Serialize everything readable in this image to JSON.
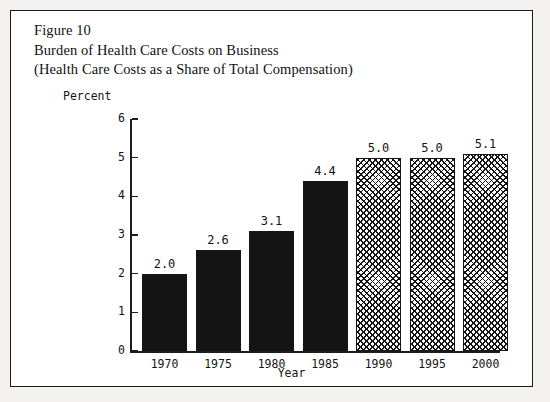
{
  "figure": {
    "title_lines": [
      "Figure 10",
      "Burden of Health Care Costs on Business",
      "(Health Care Costs as a Share of Total Compensation)"
    ]
  },
  "chart_data": {
    "type": "bar",
    "title": "Burden of Health Care Costs on Business (Health Care Costs as a Share of Total Compensation)",
    "categories": [
      "1970",
      "1975",
      "1980",
      "1985",
      "1990",
      "1995",
      "2000"
    ],
    "values": [
      2.0,
      2.6,
      3.1,
      4.4,
      5.0,
      5.0,
      5.1
    ],
    "value_labels": [
      "2.0",
      "2.6",
      "3.1",
      "4.4",
      "5.0",
      "5.0",
      "5.1"
    ],
    "series": [
      {
        "name": "Health care costs as a share of total compensation",
        "values": [
          2.0,
          2.6,
          3.1,
          4.4,
          5.0,
          5.0,
          5.1
        ],
        "styles": [
          "solid",
          "solid",
          "solid",
          "solid",
          "hatch",
          "hatch",
          "hatch"
        ]
      }
    ],
    "xlabel": "Year",
    "ylabel": "Percent",
    "ylim": [
      0,
      6
    ],
    "yticks": [
      "0",
      "1",
      "2",
      "3",
      "4",
      "5",
      "6"
    ],
    "grid": false,
    "legend": "none",
    "bar_fill_solid_color": "#141414",
    "bar_fill_hatch_color": "#141414",
    "note": "Bars for 1970-1985 are solid black (actual); bars for 1990-2000 are crosshatched (projected)"
  }
}
